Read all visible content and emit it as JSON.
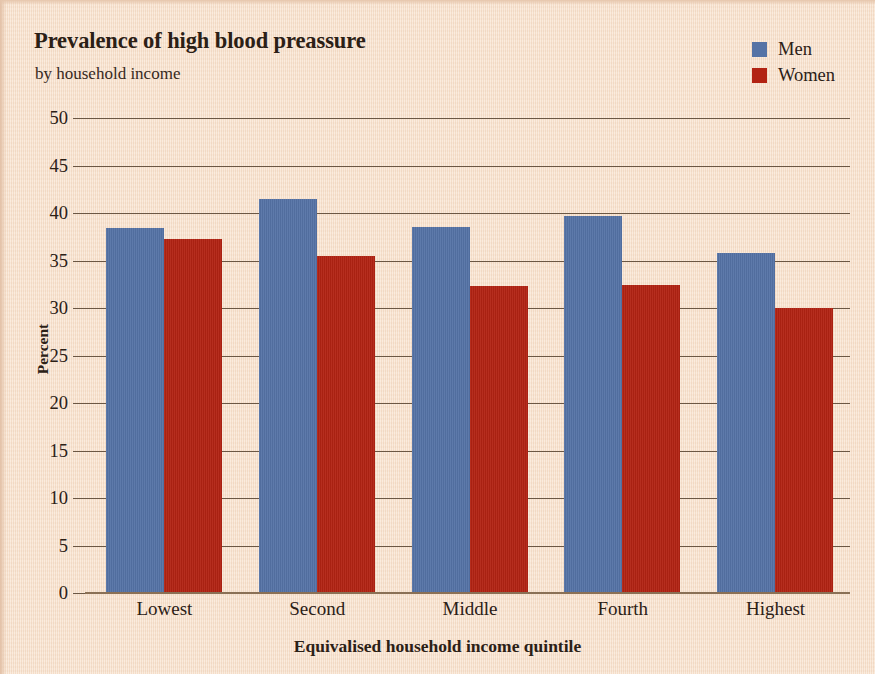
{
  "chart_data": {
    "type": "bar",
    "title": "Prevalence of high blood preassure",
    "subtitle": "by household income",
    "xlabel": "Equivalised household income quintile",
    "ylabel": "Percent",
    "categories": [
      "Lowest",
      "Second",
      "Middle",
      "Fourth",
      "Highest"
    ],
    "series": [
      {
        "name": "Men",
        "color": "#5573a6",
        "values": [
          38.4,
          41.5,
          38.5,
          39.7,
          35.8
        ]
      },
      {
        "name": "Women",
        "color": "#b22313",
        "values": [
          37.3,
          35.5,
          32.3,
          32.4,
          30.0
        ]
      }
    ],
    "ylim": [
      0,
      50
    ],
    "ytick_labels": [
      "50",
      "45",
      "40",
      "35",
      "30",
      "25",
      "20",
      "15",
      "10",
      "5",
      "0"
    ],
    "ytick_values": [
      50,
      45,
      40,
      35,
      30,
      25,
      20,
      15,
      10,
      5,
      0
    ],
    "grid": "horizontal",
    "legend_position": "top-right",
    "background_color": "#f8e1cb",
    "axis_color": "#6b5744",
    "text_color": "#2b2016"
  }
}
